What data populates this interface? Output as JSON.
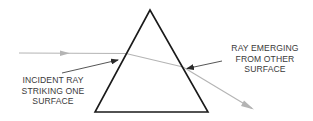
{
  "diagram": {
    "colors": {
      "background": "#ffffff",
      "prism_outline": "#1a1a1a",
      "ray": "#b4b4b4",
      "label_text": "#3a3a3a",
      "pointer_arrow": "#2a2a2a"
    },
    "labels": {
      "incident": {
        "lines": [
          "INCIDENT RAY",
          "STRIKING ONE",
          "SURFACE"
        ]
      },
      "emerging": {
        "lines": [
          "RAY EMERGING",
          "FROM OTHER",
          "SURFACE"
        ]
      }
    },
    "icons": {
      "incoming_ray_arrowhead": "arrowhead-right-icon",
      "outgoing_ray_arrowhead": "arrowhead-down-right-icon",
      "incident_pointer": "pointer-arrow-icon",
      "emerging_pointer": "pointer-arrow-icon"
    }
  }
}
